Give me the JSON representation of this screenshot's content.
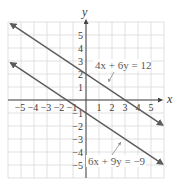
{
  "chart_data": {
    "type": "line",
    "title": "",
    "xlabel": "x",
    "ylabel": "y",
    "xlim": [
      -6,
      6
    ],
    "ylim": [
      -6,
      6
    ],
    "grid": true,
    "x_ticks": [
      -5,
      -4,
      -3,
      -2,
      -1,
      1,
      2,
      3,
      4,
      5
    ],
    "y_ticks": [
      5,
      4,
      3,
      2,
      1,
      -1,
      -2,
      -3,
      -4,
      -5
    ],
    "x_tick_labels": [
      "−5",
      "−4",
      "−3",
      "−2",
      "−1",
      "1",
      "2",
      "3",
      "4",
      "5"
    ],
    "y_tick_labels": [
      "5",
      "4",
      "3",
      "2",
      "1",
      "−1",
      "−2",
      "−3",
      "−4",
      "−5"
    ],
    "series": [
      {
        "name": "4x + 6y = 12",
        "equation": "y = 2 − (2/3)x",
        "slope": -0.6667,
        "intercept": 2,
        "x": [
          -5.8,
          5.9
        ],
        "y": [
          5.87,
          -1.93
        ],
        "arrows": "both"
      },
      {
        "name": "6x + 9y = −9",
        "equation": "y = −1 − (2/3)x",
        "slope": -0.6667,
        "intercept": -1,
        "x": [
          -5.8,
          5.9
        ],
        "y": [
          2.87,
          -4.93
        ],
        "arrows": "both"
      }
    ],
    "annotations": [
      {
        "text": "4x + 6y = 12",
        "points_to_series": 0
      },
      {
        "text": "6x + 9y = −9",
        "points_to_series": 1
      }
    ],
    "colors": {
      "line": "#5b5b5b",
      "grid": "#d9d9d9",
      "axis": "#444444",
      "leader": "#8a8a8a"
    }
  },
  "labels": {
    "x_axis": "x",
    "y_axis": "y",
    "eq1_lhs": "4x + 6y = 12",
    "eq2_lhs": "6x + 9y = −9"
  }
}
